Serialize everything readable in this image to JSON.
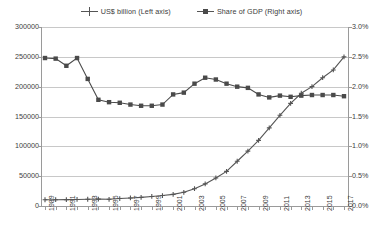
{
  "legend": {
    "position": "top-center",
    "entries": [
      {
        "label": "US$ billion (Left axis)",
        "marker": "plus-marker-icon",
        "series": "usd_billion"
      },
      {
        "label": "Share of GDP (Right axis)",
        "marker": "square-marker-icon",
        "series": "share_of_gdp"
      }
    ]
  },
  "axes": {
    "left": {
      "ticks": [
        "0",
        "50000",
        "100000",
        "150000",
        "200000",
        "250000",
        "300000"
      ],
      "min": 0,
      "max": 300000,
      "step": 50000
    },
    "right": {
      "ticks": [
        "0.0%",
        "0.5%",
        "1.0%",
        "1.5%",
        "2.0%",
        "2.5%",
        "3.0%"
      ],
      "min": 0,
      "max": 3.0,
      "step": 0.5
    },
    "bottom": {
      "labels": [
        "1989",
        "1991",
        "1993",
        "1995",
        "1997",
        "1999",
        "2001",
        "2003",
        "2005",
        "2007",
        "2009",
        "2011",
        "2013",
        "2015",
        "2017"
      ],
      "label_interval": 2
    }
  },
  "colors": {
    "series_usd": "#555555",
    "series_gdp": "#4a4a4a",
    "gridline": "#c8c8c8",
    "axis": "#9a9a9a",
    "text": "#3c3c3c",
    "background": "#ffffff"
  },
  "chart_data": {
    "type": "line",
    "title": "",
    "xlabel": "",
    "ylabel": "",
    "y2label": "",
    "grid": true,
    "legend_position": "top-center",
    "x": [
      1989,
      1990,
      1991,
      1992,
      1993,
      1994,
      1995,
      1996,
      1997,
      1998,
      1999,
      2000,
      2001,
      2002,
      2003,
      2004,
      2005,
      2006,
      2007,
      2008,
      2009,
      2010,
      2011,
      2012,
      2013,
      2014,
      2015,
      2016,
      2017
    ],
    "xlim": [
      1989,
      2017
    ],
    "ylim": [
      0,
      300000
    ],
    "y2lim": [
      0,
      3.0
    ],
    "series": [
      {
        "name": "US$ billion (Left axis)",
        "axis": "left",
        "marker": "plus",
        "unit": "US$ billion",
        "values": [
          10500,
          10600,
          10700,
          11000,
          11300,
          11500,
          11200,
          12500,
          13500,
          14500,
          16000,
          17500,
          19500,
          23000,
          29000,
          37000,
          47000,
          58000,
          75000,
          92000,
          110000,
          131000,
          152000,
          172000,
          189000,
          200000,
          215000,
          228000,
          250000
        ]
      },
      {
        "name": "Share of GDP (Right axis)",
        "axis": "right",
        "marker": "square",
        "unit": "%",
        "values": [
          2.48,
          2.47,
          2.35,
          2.48,
          2.13,
          1.78,
          1.74,
          1.73,
          1.7,
          1.68,
          1.68,
          1.7,
          1.87,
          1.9,
          2.05,
          2.15,
          2.12,
          2.05,
          2.0,
          1.98,
          1.87,
          1.82,
          1.85,
          1.83,
          1.85,
          1.86,
          1.86,
          1.86,
          1.84
        ]
      }
    ]
  }
}
